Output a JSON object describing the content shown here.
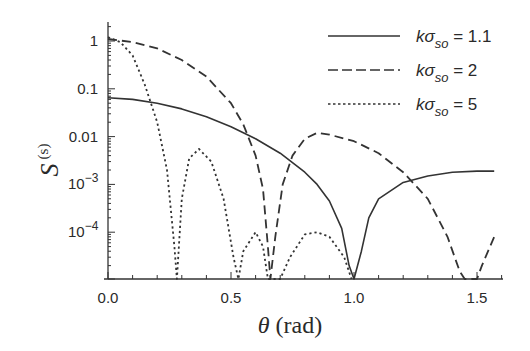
{
  "chart_data": {
    "type": "line",
    "title": "",
    "xlabel": "θ (rad)",
    "ylabel": "S(s)",
    "xlim": [
      0.0,
      1.6
    ],
    "ylim_log10": [
      -5,
      0.25
    ],
    "yscale": "log",
    "grid": false,
    "legend_position": "upper right",
    "x_ticks": [
      {
        "value": 0.0,
        "label": "0.0"
      },
      {
        "value": 0.5,
        "label": "0.5"
      },
      {
        "value": 1.0,
        "label": "1.0"
      },
      {
        "value": 1.5,
        "label": "1.5"
      }
    ],
    "y_ticks": [
      {
        "log": 0,
        "label": "1"
      },
      {
        "log": -1,
        "label": "0.1"
      },
      {
        "log": -2,
        "label": "0.01"
      },
      {
        "log": -3,
        "label": "10",
        "sup": "−3"
      },
      {
        "log": -4,
        "label": "10",
        "sup": "−4"
      }
    ],
    "series": [
      {
        "name": "kσso = 1.1",
        "legend_k": "k",
        "legend_sigma": "σ",
        "legend_sub": "so",
        "legend_val": " = 1.1",
        "style": "solid",
        "points": [
          [
            0.0,
            0.065
          ],
          [
            0.1,
            0.06
          ],
          [
            0.2,
            0.05
          ],
          [
            0.3,
            0.038
          ],
          [
            0.4,
            0.026
          ],
          [
            0.5,
            0.016
          ],
          [
            0.6,
            0.009
          ],
          [
            0.7,
            0.0045
          ],
          [
            0.8,
            0.0018
          ],
          [
            0.85,
            0.001
          ],
          [
            0.9,
            0.00045
          ],
          [
            0.95,
            0.00012
          ],
          [
            0.98,
            2e-05
          ],
          [
            1.0,
            1e-05
          ],
          [
            1.03,
            4e-05
          ],
          [
            1.06,
            0.0002
          ],
          [
            1.1,
            0.0005
          ],
          [
            1.2,
            0.0011
          ],
          [
            1.3,
            0.0015
          ],
          [
            1.4,
            0.0018
          ],
          [
            1.5,
            0.0019
          ],
          [
            1.57,
            0.0019
          ]
        ]
      },
      {
        "name": "kσso = 2",
        "legend_k": "k",
        "legend_sigma": "σ",
        "legend_sub": "so",
        "legend_val": " = 2",
        "style": "dashed",
        "points": [
          [
            0.0,
            1.1
          ],
          [
            0.1,
            0.95
          ],
          [
            0.2,
            0.7
          ],
          [
            0.3,
            0.4
          ],
          [
            0.4,
            0.18
          ],
          [
            0.5,
            0.05
          ],
          [
            0.55,
            0.018
          ],
          [
            0.6,
            0.004
          ],
          [
            0.63,
            0.0008
          ],
          [
            0.65,
            5e-05
          ],
          [
            0.66,
            1e-05
          ],
          [
            0.68,
            8e-05
          ],
          [
            0.71,
            0.001
          ],
          [
            0.75,
            0.004
          ],
          [
            0.8,
            0.009
          ],
          [
            0.85,
            0.012
          ],
          [
            0.9,
            0.011
          ],
          [
            1.0,
            0.008
          ],
          [
            1.1,
            0.0045
          ],
          [
            1.2,
            0.0018
          ],
          [
            1.3,
            0.0005
          ],
          [
            1.38,
            8e-05
          ],
          [
            1.43,
            1.5e-05
          ],
          [
            1.45,
            1e-05
          ],
          [
            1.5,
            1e-05
          ],
          [
            1.52,
            2e-05
          ],
          [
            1.57,
            8e-05
          ]
        ]
      },
      {
        "name": "kσso = 5",
        "legend_k": "k",
        "legend_sigma": "σ",
        "legend_sub": "so",
        "legend_val": " = 5",
        "style": "dotted",
        "points": [
          [
            0.0,
            1.2
          ],
          [
            0.05,
            0.95
          ],
          [
            0.1,
            0.5
          ],
          [
            0.15,
            0.12
          ],
          [
            0.2,
            0.02
          ],
          [
            0.24,
            0.002
          ],
          [
            0.27,
            5e-05
          ],
          [
            0.28,
            1e-05
          ],
          [
            0.3,
            0.0005
          ],
          [
            0.33,
            0.0035
          ],
          [
            0.37,
            0.0055
          ],
          [
            0.42,
            0.003
          ],
          [
            0.47,
            0.0005
          ],
          [
            0.51,
            3e-05
          ],
          [
            0.53,
            1e-05
          ],
          [
            0.55,
            4e-05
          ],
          [
            0.6,
            0.0001
          ],
          [
            0.63,
            5e-05
          ],
          [
            0.65,
            1e-05
          ],
          [
            0.7,
            1e-05
          ],
          [
            0.74,
            3e-05
          ],
          [
            0.8,
            9e-05
          ],
          [
            0.85,
            0.0001
          ],
          [
            0.9,
            8e-05
          ],
          [
            0.96,
            3e-05
          ],
          [
            0.99,
            1e-05
          ]
        ]
      }
    ]
  }
}
